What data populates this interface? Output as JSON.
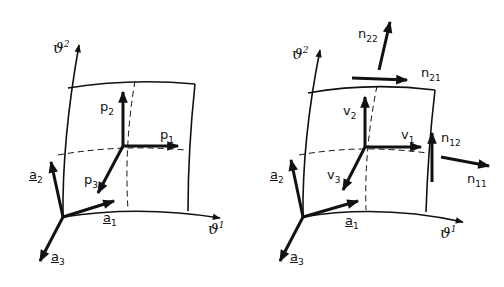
{
  "figures": [
    {
      "name": "shell-element-loads",
      "labels": {
        "theta2": {
          "base": "ϑ",
          "sup": "2"
        },
        "theta1": {
          "base": "ϑ",
          "sup": "1"
        },
        "p1": {
          "base": "p",
          "sub": "1"
        },
        "p2": {
          "base": "p",
          "sub": "2"
        },
        "p3": {
          "base": "p",
          "sub": "3"
        },
        "a1": {
          "base": "a",
          "sub": "1"
        },
        "a2": {
          "base": "a",
          "sub": "2"
        },
        "a3": {
          "base": "a",
          "sub": "3"
        }
      }
    },
    {
      "name": "shell-element-stress-resultants",
      "labels": {
        "theta2": {
          "base": "ϑ",
          "sup": "2"
        },
        "theta1": {
          "base": "ϑ",
          "sup": "1"
        },
        "v1": {
          "base": "v",
          "sub": "1"
        },
        "v2": {
          "base": "v",
          "sub": "2"
        },
        "v3": {
          "base": "v",
          "sub": "3"
        },
        "a1": {
          "base": "a",
          "sub": "1"
        },
        "a2": {
          "base": "a",
          "sub": "2"
        },
        "a3": {
          "base": "a",
          "sub": "3"
        },
        "n11": {
          "base": "n",
          "sub": "11"
        },
        "n12": {
          "base": "n",
          "sub": "12"
        },
        "n21": {
          "base": "n",
          "sub": "21"
        },
        "n22": {
          "base": "n",
          "sub": "22"
        }
      }
    }
  ],
  "style": {
    "ink": "#111111",
    "background": "#ffffff"
  }
}
